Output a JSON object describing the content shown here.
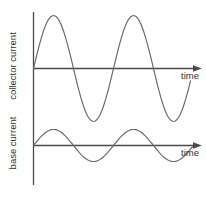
{
  "figure": {
    "background": "#ffffff",
    "wave_color": "#6b6b6b",
    "axis_color": "#4a4a4a",
    "text_color": "#2e2e2e"
  },
  "top_plot": {
    "ylabel": "collector current",
    "xlabel": "time"
  },
  "bottom_plot": {
    "ylabel": "base current",
    "xlabel": "time"
  },
  "chart_data": [
    {
      "type": "line",
      "name": "collector-current",
      "ylabel": "collector current",
      "xlabel": "time",
      "waveform": "sine",
      "cycles_shown": 2,
      "relative_amplitude": 1.0,
      "phase": "starts at zero rising at the vertical axis",
      "axis_y": 68.5,
      "amplitude_px": 53,
      "x_start": 33.5,
      "x_end": 191,
      "period_px": 80
    },
    {
      "type": "line",
      "name": "base-current",
      "ylabel": "base current",
      "xlabel": "time",
      "waveform": "sine",
      "cycles_shown": 2,
      "relative_amplitude": 0.3,
      "phase": "in phase with collector current, starts at zero rising",
      "axis_y": 145.5,
      "amplitude_px": 16,
      "x_start": 33.5,
      "x_end": 193,
      "period_px": 80
    }
  ]
}
